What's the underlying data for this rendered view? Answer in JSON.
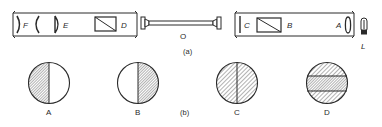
{
  "figure": {
    "part_a": {
      "caption": "(a)",
      "left_tube": {
        "components": [
          {
            "id": "F",
            "label": "F",
            "kind": "eyepiece-lens"
          },
          {
            "id": "F2",
            "label": "",
            "kind": "eyepiece-lens"
          },
          {
            "id": "E",
            "label": "E",
            "kind": "lens"
          },
          {
            "id": "D",
            "label": "D",
            "kind": "analyser-prism"
          }
        ]
      },
      "tube": {
        "label": "O",
        "kind": "sample-tube"
      },
      "right_tube": {
        "components": [
          {
            "id": "C",
            "label": "C",
            "kind": "half-shade-plate"
          },
          {
            "id": "B",
            "label": "B",
            "kind": "polariser-prism"
          },
          {
            "id": "A",
            "label": "A",
            "kind": "condenser-lens"
          }
        ]
      },
      "lamp": {
        "label": "L",
        "kind": "light-source"
      }
    },
    "part_b": {
      "caption": "(b)",
      "fields": [
        {
          "label": "A",
          "pattern": "left-half-shaded"
        },
        {
          "label": "B",
          "pattern": "right-half-shaded"
        },
        {
          "label": "C",
          "pattern": "both-halves-equally-shaded"
        },
        {
          "label": "D",
          "pattern": "center-band-darker"
        }
      ]
    },
    "colors": {
      "line": "#2a2a2a",
      "hatch": "#555555",
      "background": "#ffffff"
    }
  }
}
